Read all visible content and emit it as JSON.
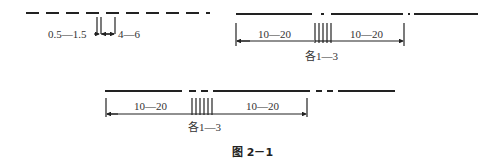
{
  "figure": {
    "caption": "图 2－1",
    "diagram_a": {
      "description": "dashed line with two cut marks",
      "labels": {
        "gap_width": "0.5—1.5",
        "spacing": "4—6"
      }
    },
    "diagram_b": {
      "description": "long solid line with short break, four cut marks between two dimension spans",
      "labels": {
        "left_span": "10—20",
        "right_span": "10—20",
        "each": "各1—3"
      }
    },
    "diagram_c": {
      "description": "solid line with dashed breaks, six cut marks between two dimension spans",
      "labels": {
        "left_span": "10—20",
        "right_span": "10—20",
        "each": "各1—3"
      }
    }
  }
}
